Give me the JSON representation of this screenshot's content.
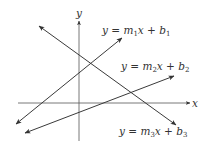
{
  "axes": {
    "x_label": "x",
    "y_label": "y"
  },
  "lines": [
    {
      "name": "line-1",
      "label_parts": {
        "y": "y",
        "eq": " = ",
        "m": "m",
        "m_sub": "1",
        "x": "x",
        "plus": " + ",
        "b": "b",
        "b_sub": "1"
      },
      "slope": "positive"
    },
    {
      "name": "line-2",
      "label_parts": {
        "y": "y",
        "eq": " = ",
        "m": "m",
        "m_sub": "2",
        "x": "x",
        "plus": " + ",
        "b": "b",
        "b_sub": "2"
      },
      "slope": "positive"
    },
    {
      "name": "line-3",
      "label_parts": {
        "y": "y",
        "eq": " = ",
        "m": "m",
        "m_sub": "3",
        "x": "x",
        "plus": " + ",
        "b": "b",
        "b_sub": "3"
      },
      "slope": "negative"
    }
  ],
  "colors": {
    "line": "#3a3a3a",
    "text": "#333333",
    "background": "#ffffff"
  }
}
